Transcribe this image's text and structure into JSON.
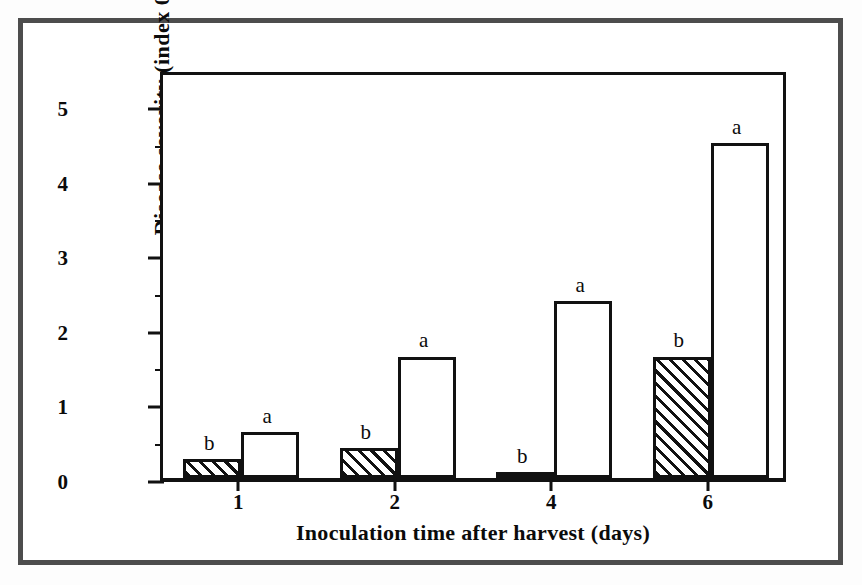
{
  "chart_data": {
    "type": "bar",
    "title": "",
    "xlabel": "Inoculation time after harvest (days)",
    "ylabel": "Disease severity (index 0-5)",
    "categories": [
      "1",
      "2",
      "4",
      "6"
    ],
    "ylim": [
      0,
      5.5
    ],
    "yticks": [
      0,
      1,
      2,
      3,
      4,
      5
    ],
    "ytick_labels": [
      "0",
      "1",
      "2",
      "3",
      "4",
      "5"
    ],
    "yticks_minor": [
      0.5,
      1.5,
      2.5,
      3.5,
      4.5
    ],
    "grid": false,
    "legend": "none",
    "series": [
      {
        "name": "hatched",
        "fill": "diagonal-hatch",
        "values": [
          0.25,
          0.4,
          0.08,
          1.63
        ],
        "letters": [
          "b",
          "b",
          "b",
          "b"
        ]
      },
      {
        "name": "open",
        "fill": "white",
        "values": [
          0.62,
          1.63,
          2.37,
          4.5
        ],
        "letters": [
          "a",
          "a",
          "a",
          "a"
        ]
      }
    ],
    "annotations": [
      {
        "text": "b",
        "category": "1",
        "series": "hatched"
      },
      {
        "text": "a",
        "category": "1",
        "series": "open"
      },
      {
        "text": "b",
        "category": "2",
        "series": "hatched"
      },
      {
        "text": "a",
        "category": "2",
        "series": "open"
      },
      {
        "text": "b",
        "category": "4",
        "series": "hatched"
      },
      {
        "text": "a",
        "category": "4",
        "series": "open"
      },
      {
        "text": "b",
        "category": "6",
        "series": "hatched"
      },
      {
        "text": "a",
        "category": "6",
        "series": "open"
      }
    ]
  },
  "colors": {
    "frame": "#4d4d4d",
    "axis": "#111111",
    "text": "#0b0b0b",
    "background": "#ffffff"
  }
}
